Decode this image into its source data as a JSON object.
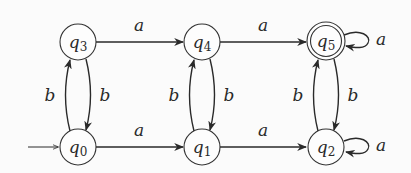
{
  "diagram": {
    "type": "finite-automaton",
    "states": [
      {
        "id": "q0",
        "name": "q",
        "sub": "0",
        "x": 78,
        "y": 147,
        "initial": true,
        "accepting": false
      },
      {
        "id": "q1",
        "name": "q",
        "sub": "1",
        "x": 202,
        "y": 147,
        "initial": false,
        "accepting": false
      },
      {
        "id": "q2",
        "name": "q",
        "sub": "2",
        "x": 326,
        "y": 147,
        "initial": false,
        "accepting": false
      },
      {
        "id": "q3",
        "name": "q",
        "sub": "3",
        "x": 78,
        "y": 42,
        "initial": false,
        "accepting": false
      },
      {
        "id": "q4",
        "name": "q",
        "sub": "4",
        "x": 202,
        "y": 42,
        "initial": false,
        "accepting": false
      },
      {
        "id": "q5",
        "name": "q",
        "sub": "5",
        "x": 326,
        "y": 41,
        "initial": false,
        "accepting": true
      }
    ],
    "transitions": [
      {
        "from": "q3",
        "to": "q4",
        "label": "a"
      },
      {
        "from": "q4",
        "to": "q5",
        "label": "a"
      },
      {
        "from": "q5",
        "to": "q5",
        "label": "a"
      },
      {
        "from": "q0",
        "to": "q1",
        "label": "a"
      },
      {
        "from": "q1",
        "to": "q2",
        "label": "a"
      },
      {
        "from": "q2",
        "to": "q2",
        "label": "a"
      },
      {
        "from": "q0",
        "to": "q3",
        "label": "b"
      },
      {
        "from": "q3",
        "to": "q0",
        "label": "b"
      },
      {
        "from": "q1",
        "to": "q4",
        "label": "b"
      },
      {
        "from": "q4",
        "to": "q1",
        "label": "b"
      },
      {
        "from": "q2",
        "to": "q5",
        "label": "b"
      },
      {
        "from": "q5",
        "to": "q2",
        "label": "b"
      }
    ]
  },
  "labels": {
    "q0": {
      "name": "q",
      "sub": "0"
    },
    "q1": {
      "name": "q",
      "sub": "1"
    },
    "q2": {
      "name": "q",
      "sub": "2"
    },
    "q3": {
      "name": "q",
      "sub": "3"
    },
    "q4": {
      "name": "q",
      "sub": "4"
    },
    "q5": {
      "name": "q",
      "sub": "5"
    },
    "e_q3_q4": "a",
    "e_q4_q5": "a",
    "e_q5_loop": "a",
    "e_q0_q1": "a",
    "e_q1_q2": "a",
    "e_q2_loop": "a",
    "e_q0_q3": "b",
    "e_q3_q0": "b",
    "e_q1_q4": "b",
    "e_q4_q1": "b",
    "e_q2_q5": "b",
    "e_q5_q2": "b"
  }
}
